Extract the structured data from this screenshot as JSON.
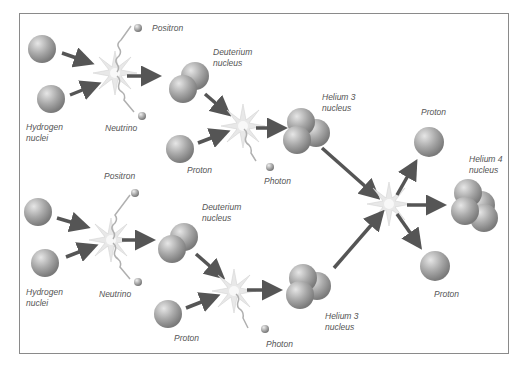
{
  "diagram": {
    "labels": {
      "hydrogen_top": [
        "Hydrogen",
        "nuclei"
      ],
      "positron_top": "Positron",
      "neutrino_top": "Neutrino",
      "deuterium_top": [
        "Deuterium",
        "nucleus"
      ],
      "proton_top": "Proton",
      "photon_top": "Photon",
      "helium3_top": [
        "Helium 3",
        "nucleus"
      ],
      "proton_out_top": "Proton",
      "helium4": [
        "Helium 4",
        "nucleus"
      ],
      "proton_out_bottom": "Proton",
      "hydrogen_bottom": [
        "Hydrogen",
        "nuclei"
      ],
      "positron_bottom": "Positron",
      "neutrino_bottom": "Neutrino",
      "deuterium_bottom": [
        "Deuterium",
        "nucleus"
      ],
      "proton_bottom": "Proton",
      "photon_bottom": "Photon",
      "helium3_bottom": [
        "Helium 3",
        "nucleus"
      ]
    },
    "particle_symbols": {
      "positron": "e",
      "neutrino": "ν",
      "photon": "γ"
    },
    "colors": {
      "nucleus": "#a8a8a8",
      "arrow": "#555555",
      "flash": "#e4e4e4",
      "frame": "#8a8a8a",
      "text": "#555555"
    }
  }
}
